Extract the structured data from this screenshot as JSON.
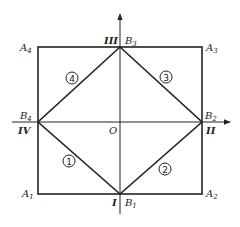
{
  "diagram": {
    "corners": {
      "A1": {
        "label": "A",
        "sub": "1"
      },
      "A2": {
        "label": "A",
        "sub": "2"
      },
      "A3": {
        "label": "A",
        "sub": "3"
      },
      "A4": {
        "label": "A",
        "sub": "4"
      }
    },
    "midpoints": {
      "B1": {
        "label": "B",
        "sub": "1"
      },
      "B2": {
        "label": "B",
        "sub": "2"
      },
      "B3": {
        "label": "B",
        "sub": "3"
      },
      "B4": {
        "label": "B",
        "sub": "4"
      }
    },
    "axis_labels": {
      "I": "I",
      "II": "II",
      "III": "III",
      "IV": "IV"
    },
    "origin": "O",
    "regions": [
      "1",
      "2",
      "3",
      "4"
    ],
    "colors": {
      "stroke": "#222222",
      "background": "#ffffff"
    }
  }
}
